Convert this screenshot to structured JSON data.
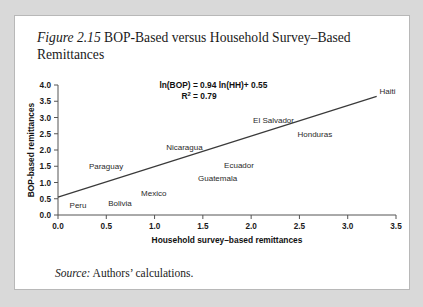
{
  "figure": {
    "number": "Figure 2.15",
    "title": " BOP-Based versus Household Survey–Based Remittances",
    "source_label": "Source:",
    "source_text": " Authors’ calculations."
  },
  "chart_data": {
    "type": "scatter",
    "title": "",
    "xlabel": "Household survey–based remittances",
    "ylabel": "BOP-based remittances",
    "xlim": [
      0.0,
      3.5
    ],
    "ylim": [
      0.0,
      4.0
    ],
    "xticks": [
      "0.0",
      "0.5",
      "1.0",
      "1.5",
      "2.0",
      "2.5",
      "3.0",
      "3.5"
    ],
    "yticks": [
      "0.0",
      "0.5",
      "1.0",
      "1.5",
      "2.0",
      "2.5",
      "3.0",
      "3.5",
      "4.0"
    ],
    "grid": false,
    "legend": "none",
    "annotations": [
      {
        "text": "ln(BOP) = 0.94 ln(HH)+ 0.55",
        "x": 1.05,
        "y": 3.92
      },
      {
        "text": "R",
        "sup": "2",
        "rest": " = 0.79",
        "x": 1.05,
        "y": 3.58
      }
    ],
    "fit_line": {
      "slope": 0.94,
      "intercept": 0.55,
      "x_start": 0.0,
      "y_start": 0.55,
      "x_end": 3.3,
      "y_end": 3.65
    },
    "labels": [
      {
        "name": "Peru",
        "x": 0.12,
        "y": 0.23
      },
      {
        "name": "Bolivia",
        "x": 0.52,
        "y": 0.27
      },
      {
        "name": "Mexico",
        "x": 0.86,
        "y": 0.6
      },
      {
        "name": "Paraguay",
        "x": 0.32,
        "y": 1.42
      },
      {
        "name": "Guatemala",
        "x": 1.45,
        "y": 1.05
      },
      {
        "name": "Ecuador",
        "x": 1.72,
        "y": 1.44
      },
      {
        "name": "Nicaragua",
        "x": 1.12,
        "y": 2.0
      },
      {
        "name": "El Salvador",
        "x": 2.02,
        "y": 2.82
      },
      {
        "name": "Honduras",
        "x": 2.48,
        "y": 2.4
      },
      {
        "name": "Haiti",
        "x": 3.33,
        "y": 3.72
      }
    ]
  }
}
